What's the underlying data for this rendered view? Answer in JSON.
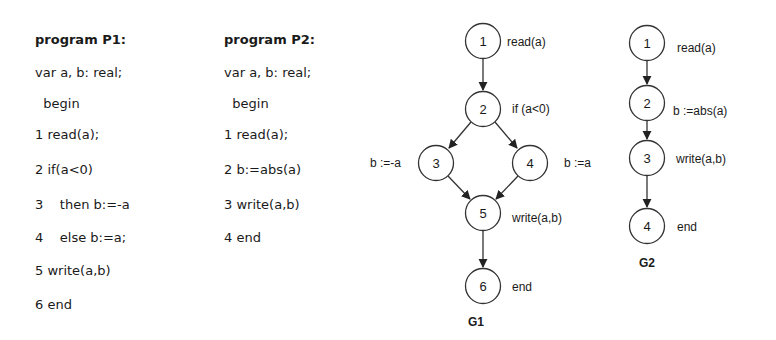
{
  "programs": [
    {
      "title": "program P1:",
      "lines": [
        "var a, b: real;",
        "  begin",
        "1 read(a);",
        "2 if(a<0)",
        "3    then b:=-a",
        "4    else b:=a;",
        "5 write(a,b)",
        "6 end"
      ]
    },
    {
      "title": "program P2:",
      "lines": [
        "var a, b: real;",
        "  begin",
        "1 read(a);",
        "2 b:=abs(a)",
        "3 write(a,b)",
        "4 end"
      ]
    }
  ],
  "graphs": [
    {
      "caption": "G1",
      "nodes": [
        {
          "id": "1",
          "label": "read(a)"
        },
        {
          "id": "2",
          "label": "if (a<0)"
        },
        {
          "id": "3",
          "label": "b :=-a"
        },
        {
          "id": "4",
          "label": "b :=a"
        },
        {
          "id": "5",
          "label": "write(a,b)"
        },
        {
          "id": "6",
          "label": "end"
        }
      ],
      "edges": [
        [
          "1",
          "2"
        ],
        [
          "2",
          "3"
        ],
        [
          "2",
          "4"
        ],
        [
          "3",
          "5"
        ],
        [
          "4",
          "5"
        ],
        [
          "5",
          "6"
        ]
      ]
    },
    {
      "caption": "G2",
      "nodes": [
        {
          "id": "1",
          "label": "read(a)"
        },
        {
          "id": "2",
          "label": "b :=abs(a)"
        },
        {
          "id": "3",
          "label": "write(a,b)"
        },
        {
          "id": "4",
          "label": "end"
        }
      ],
      "edges": [
        [
          "1",
          "2"
        ],
        [
          "2",
          "3"
        ],
        [
          "3",
          "4"
        ]
      ]
    }
  ]
}
